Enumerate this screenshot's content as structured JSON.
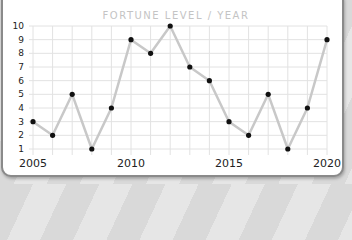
{
  "chart_data": {
    "type": "line",
    "title": "FORTUNE LEVEL / YEAR",
    "xlabel": "",
    "ylabel": "",
    "x": [
      2005,
      2006,
      2007,
      2008,
      2009,
      2010,
      2011,
      2012,
      2013,
      2014,
      2015,
      2016,
      2017,
      2018,
      2019,
      2020
    ],
    "series": [
      {
        "name": "Fortune level",
        "values": [
          3,
          2,
          5,
          1,
          4,
          9,
          8,
          10,
          7,
          6,
          3,
          2,
          5,
          1,
          4,
          9
        ]
      }
    ],
    "x_tick_labels": [
      "2005",
      "2010",
      "2015",
      "2020"
    ],
    "y_tick_labels": [
      "1",
      "2",
      "3",
      "4",
      "5",
      "6",
      "7",
      "8",
      "9",
      "10"
    ],
    "xlim": [
      2005,
      2020
    ],
    "ylim": [
      1,
      10
    ],
    "grid": true,
    "legend": "none",
    "colors": {
      "line": "#c8c8c8",
      "marker": "#111111",
      "grid": "#e2e2e2",
      "title": "#c4c4c4"
    }
  }
}
